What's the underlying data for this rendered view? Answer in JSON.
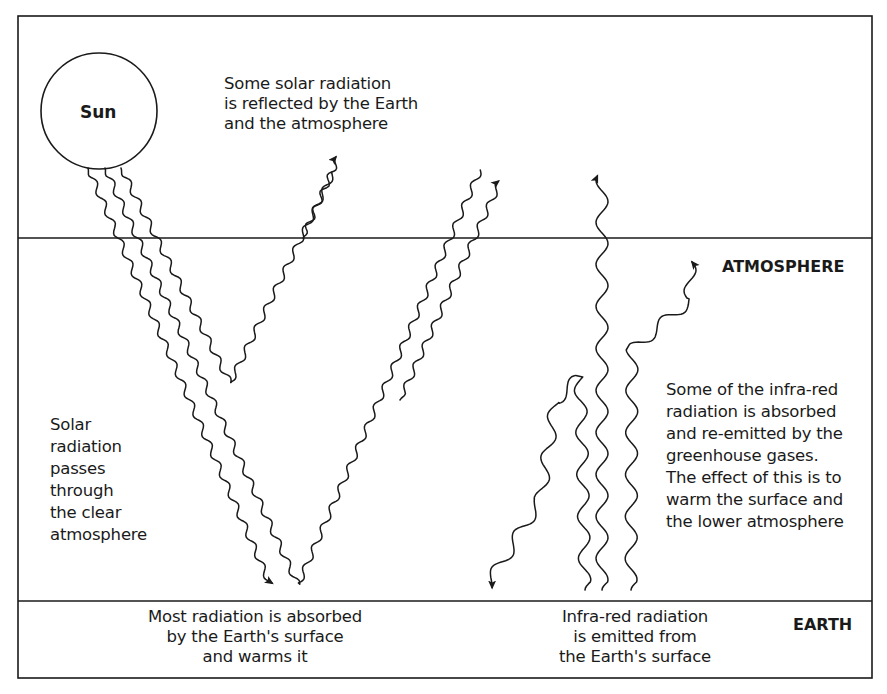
{
  "colors": {
    "ink": "#1a1a1a",
    "background": "#ffffff"
  },
  "layers": {
    "atmosphere": "ATMOSPHERE",
    "earth": "EARTH"
  },
  "sun": {
    "label": "Sun"
  },
  "labels": {
    "reflected": [
      "Some solar radiation",
      "is reflected by the Earth",
      "and the atmosphere"
    ],
    "passes": [
      "Solar",
      "radiation",
      "passes",
      "through",
      "the clear",
      "atmosphere"
    ],
    "greenhouse": [
      "Some of the infra-red",
      "radiation is absorbed",
      "and re-emitted by the",
      "greenhouse gases.",
      "The effect of this is to",
      "warm the surface and",
      "the lower atmosphere"
    ],
    "absorbed": [
      "Most radiation is absorbed",
      "by the Earth's surface",
      "and warms it"
    ],
    "emitted": [
      "Infra-red radiation",
      "is emitted from",
      "the Earth's surface"
    ]
  }
}
